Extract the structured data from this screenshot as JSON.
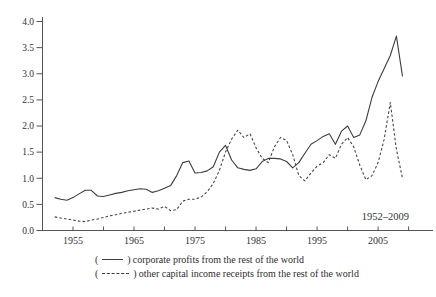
{
  "figure": {
    "annotation": "1952–2009",
    "legend_open": "(",
    "legend_close": ")"
  },
  "chart_data": {
    "type": "line",
    "title": "",
    "xlabel": "",
    "ylabel": "",
    "grid": false,
    "legend_position": "below",
    "annotation": "1952–2009",
    "xlim": [
      1950,
      2014
    ],
    "ylim": [
      0,
      4.0
    ],
    "x_ticks": [
      1955,
      1960,
      1965,
      1970,
      1975,
      1980,
      1985,
      1990,
      1995,
      2000,
      2005,
      2010
    ],
    "x_tick_labels": [
      "1955",
      "",
      "1965",
      "",
      "1975",
      "",
      "1985",
      "",
      "1995",
      "",
      "2005",
      ""
    ],
    "y_tick_labels": [
      "0.0",
      "0.5",
      "1.0",
      "1.5",
      "2.0",
      "2.5",
      "3.0",
      "3.5",
      "4.0"
    ],
    "x": [
      1952,
      1953,
      1954,
      1955,
      1956,
      1957,
      1958,
      1959,
      1960,
      1961,
      1962,
      1963,
      1964,
      1965,
      1966,
      1967,
      1968,
      1969,
      1970,
      1971,
      1972,
      1973,
      1974,
      1975,
      1976,
      1977,
      1978,
      1979,
      1980,
      1981,
      1982,
      1983,
      1984,
      1985,
      1986,
      1987,
      1988,
      1989,
      1990,
      1991,
      1992,
      1993,
      1994,
      1995,
      1996,
      1997,
      1998,
      1999,
      2000,
      2001,
      2002,
      2003,
      2004,
      2005,
      2006,
      2007,
      2008,
      2009
    ],
    "series": [
      {
        "name": "corporate profits from the rest of the world",
        "style": "solid",
        "color": "#3d3d3d",
        "values": [
          0.63,
          0.6,
          0.58,
          0.63,
          0.7,
          0.77,
          0.77,
          0.66,
          0.65,
          0.68,
          0.71,
          0.73,
          0.76,
          0.78,
          0.8,
          0.79,
          0.73,
          0.76,
          0.81,
          0.86,
          1.05,
          1.3,
          1.33,
          1.1,
          1.11,
          1.14,
          1.22,
          1.5,
          1.63,
          1.35,
          1.2,
          1.17,
          1.15,
          1.18,
          1.32,
          1.38,
          1.38,
          1.37,
          1.32,
          1.2,
          1.3,
          1.48,
          1.65,
          1.72,
          1.8,
          1.85,
          1.65,
          1.9,
          2.0,
          1.78,
          1.83,
          2.1,
          2.55,
          2.85,
          3.1,
          3.35,
          3.72,
          2.95
        ]
      },
      {
        "name": "other capital income receipts from the rest of the world",
        "style": "dashed",
        "color": "#474747",
        "values": [
          0.26,
          0.24,
          0.22,
          0.2,
          0.18,
          0.17,
          0.2,
          0.22,
          0.25,
          0.28,
          0.3,
          0.33,
          0.35,
          0.37,
          0.39,
          0.41,
          0.43,
          0.41,
          0.46,
          0.38,
          0.4,
          0.56,
          0.6,
          0.6,
          0.64,
          0.74,
          0.9,
          1.15,
          1.5,
          1.75,
          1.92,
          1.78,
          1.85,
          1.58,
          1.38,
          1.3,
          1.6,
          1.78,
          1.72,
          1.45,
          1.05,
          0.95,
          1.1,
          1.23,
          1.3,
          1.45,
          1.38,
          1.65,
          1.78,
          1.6,
          1.25,
          0.97,
          1.05,
          1.3,
          1.75,
          2.45,
          1.55,
          1.0
        ]
      }
    ]
  }
}
